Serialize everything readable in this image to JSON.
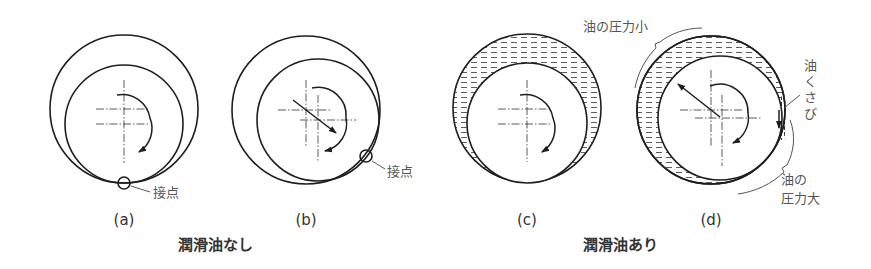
{
  "figure": {
    "panels": [
      {
        "id": "a",
        "label": "(a)",
        "annotation": "接点",
        "oil": false,
        "state": "stationary, journal resting at bottom"
      },
      {
        "id": "b",
        "label": "(b)",
        "annotation": "接点",
        "oil": false,
        "state": "rotating, contact point climbs right"
      },
      {
        "id": "c",
        "label": "(c)",
        "annotation": "",
        "oil": true,
        "state": "oil film, stationary"
      },
      {
        "id": "d",
        "label": "(d)",
        "annotation": "",
        "oil": true,
        "state": "oil wedge forms, journal lifts"
      }
    ],
    "groups": [
      {
        "id": "no-oil",
        "label": "潤滑油なし",
        "panels": [
          "a",
          "b"
        ]
      },
      {
        "id": "with-oil",
        "label": "潤滑油あり",
        "panels": [
          "c",
          "d"
        ]
      }
    ],
    "annotations_d": {
      "pressure_low": "油の圧力小",
      "oil_wedge": [
        "油",
        "く",
        "さ",
        "び"
      ],
      "pressure_high_line1": "油の",
      "pressure_high_line2": "圧力大"
    }
  },
  "colors": {
    "stroke": "#1e1e1e",
    "text": "#555555",
    "background": "#ffffff"
  }
}
